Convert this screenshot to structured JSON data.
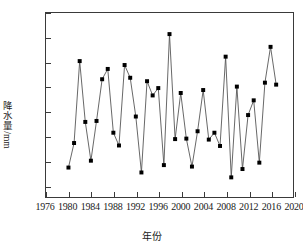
{
  "chart_data": {
    "type": "line",
    "title": "",
    "xlabel": "年份",
    "ylabel": "降水量/mm",
    "xlim": [
      1976,
      2020
    ],
    "ylim": [
      275,
      650
    ],
    "xticks": [
      1976,
      1980,
      1984,
      1988,
      1992,
      1996,
      2000,
      2004,
      2008,
      2012,
      2016,
      2020
    ],
    "yticks": [
      300,
      350,
      400,
      450,
      500,
      550,
      600,
      650
    ],
    "grid": false,
    "legend": false,
    "marker": "square-filled",
    "marker_color": "#000000",
    "line_color": "#555555",
    "x": [
      1980,
      1981,
      1982,
      1983,
      1984,
      1985,
      1986,
      1987,
      1988,
      1989,
      1990,
      1991,
      1992,
      1993,
      1994,
      1995,
      1996,
      1997,
      1998,
      1999,
      2000,
      2001,
      2002,
      2003,
      2004,
      2005,
      2006,
      2007,
      2008,
      2009,
      2010,
      2011,
      2012,
      2013,
      2014,
      2015,
      2016,
      2017
    ],
    "values": [
      335,
      385,
      552,
      428,
      349,
      430,
      515,
      536,
      406,
      380,
      544,
      518,
      439,
      325,
      511,
      482,
      497,
      340,
      607,
      393,
      487,
      394,
      337,
      409,
      493,
      392,
      406,
      379,
      561,
      315,
      500,
      332,
      442,
      472,
      345,
      508,
      581,
      504
    ],
    "series_name": "年降水量"
  }
}
